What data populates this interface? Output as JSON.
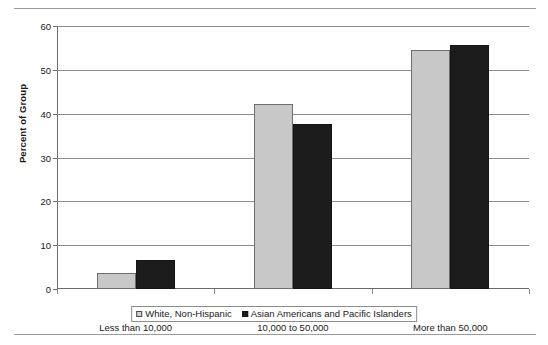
{
  "chart_data": {
    "type": "bar",
    "title": "",
    "subtitle": "",
    "xlabel": "",
    "ylabel": "Percent of Group",
    "categories": [
      "Less than 10,000",
      "10,000 to 50,000",
      "More than 50,000"
    ],
    "series": [
      {
        "name": "White, Non-Hispanic",
        "color": "#c8c8c8",
        "values": [
          3.7,
          42.2,
          54.5
        ]
      },
      {
        "name": "Asian Americans and Pacific Islanders",
        "color": "#1c1c1c",
        "values": [
          6.6,
          37.6,
          55.7
        ]
      }
    ],
    "ylim": [
      0,
      60
    ],
    "yticks": [
      0,
      10,
      20,
      30,
      40,
      50,
      60
    ],
    "ytick_labels": [
      "0",
      "10",
      "20",
      "30",
      "40",
      "50",
      "60"
    ],
    "grid": true,
    "legend_position": "bottom"
  },
  "legend": {
    "entries": [
      {
        "label": "White, Non-Hispanic",
        "marker": "legend-swatch-white-non-hispanic"
      },
      {
        "label": "Asian Americans and Pacific Islanders",
        "marker": "legend-swatch-asian-americans-pacific-islanders"
      }
    ]
  }
}
